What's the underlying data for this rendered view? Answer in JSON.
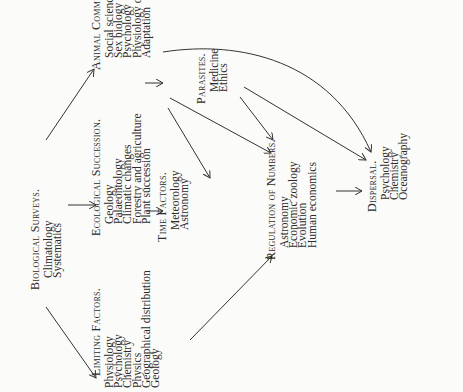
{
  "nodes": {
    "biological_surveys": {
      "heading": "Biological Surveys.",
      "items": [
        "Climatology",
        "Systematics"
      ]
    },
    "limiting_factors": {
      "heading": "Limiting Factors.",
      "items": [
        "Physiology",
        "Psychology",
        "Chemistry",
        "Physics",
        "Geographical distribution",
        "Geology"
      ]
    },
    "ecological_succession": {
      "heading": "Ecological Succession.",
      "items": [
        "Geology",
        "Palaeontology",
        "Climatic changes",
        "Forestry and agriculture",
        "Plant succession"
      ]
    },
    "animal_communities": {
      "heading": "Animal Communities.",
      "items": [
        "Social science",
        "Sex biology",
        "Psychology",
        "Physiology of food",
        "Adaptation"
      ]
    },
    "time_factors": {
      "heading": "Time Factors.",
      "items": [
        "Meteorology",
        "Astronomy"
      ]
    },
    "parasites": {
      "heading": "Parasites.",
      "items": [
        "Medicine",
        "Ethics"
      ]
    },
    "regulation_of_numbers": {
      "heading": "Regulation of Numbers.",
      "items": [
        "Astronomy",
        "Economic zoology",
        "Evolution",
        "Human economics"
      ]
    },
    "dispersal": {
      "heading": "Dispersal.",
      "items": [
        "Psychology",
        "Chemistry",
        "Oceanography"
      ]
    }
  },
  "edges": [
    [
      "biological_surveys",
      "limiting_factors"
    ],
    [
      "biological_surveys",
      "ecological_succession"
    ],
    [
      "biological_surveys",
      "animal_communities"
    ],
    [
      "ecological_succession",
      "time_factors"
    ],
    [
      "animal_communities",
      "parasites"
    ],
    [
      "animal_communities",
      "time_factors"
    ],
    [
      "animal_communities",
      "regulation_of_numbers"
    ],
    [
      "animal_communities",
      "dispersal"
    ],
    [
      "limiting_factors",
      "regulation_of_numbers"
    ],
    [
      "parasites",
      "regulation_of_numbers"
    ],
    [
      "parasites",
      "dispersal"
    ],
    [
      "regulation_of_numbers",
      "dispersal"
    ]
  ]
}
